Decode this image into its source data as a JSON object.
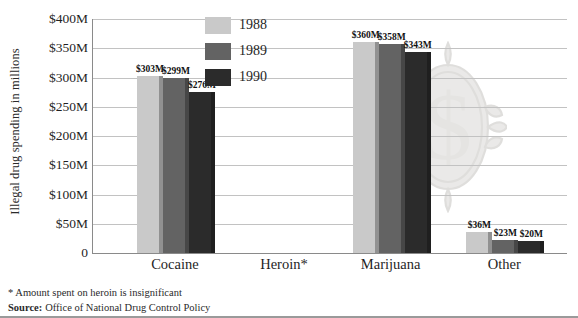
{
  "chart_data": {
    "type": "bar",
    "title": "",
    "xlabel": "",
    "ylabel": "Illegal drug spending in millions",
    "categories": [
      "Cocaine",
      "Heroin*",
      "Marijuana",
      "Other"
    ],
    "series": [
      {
        "name": "1988",
        "color": "#c9c9c9",
        "values": [
          303,
          0,
          360,
          36
        ],
        "labels": [
          "$303M",
          "",
          "$360M",
          "$36M"
        ]
      },
      {
        "name": "1989",
        "color": "#636363",
        "values": [
          299,
          0,
          358,
          23
        ],
        "labels": [
          "$299M",
          "",
          "$358M",
          "$23M"
        ]
      },
      {
        "name": "1990",
        "color": "#2b2b2b",
        "values": [
          276,
          0,
          343,
          20
        ],
        "labels": [
          "$276M",
          "",
          "$343M",
          "$20M"
        ]
      }
    ],
    "ylim": [
      0,
      400
    ],
    "ytick_values": [
      400,
      350,
      300,
      250,
      200,
      150,
      100,
      50,
      0
    ],
    "ytick_labels": [
      "$400M",
      "$350M",
      "$300M",
      "$250M",
      "$200M",
      "$150M",
      "$100M",
      "$50M",
      "0"
    ],
    "grid": true,
    "legend_position": "top-center",
    "unit": "millions of dollars",
    "annotations": [
      "* Amount spent on heroin is insignificant"
    ]
  },
  "legend": {
    "entries": [
      {
        "label": "1988",
        "color": "#c9c9c9"
      },
      {
        "label": "1989",
        "color": "#636363"
      },
      {
        "label": "1990",
        "color": "#2b2b2b"
      }
    ]
  },
  "footnotes": {
    "asterisk_note": "* Amount spent on heroin is insignificant",
    "source_label": "Source:",
    "source_text": "Office of National Drug Control Policy"
  },
  "watermark": {
    "name": "dollar-sign-medallion",
    "symbol": "$"
  }
}
